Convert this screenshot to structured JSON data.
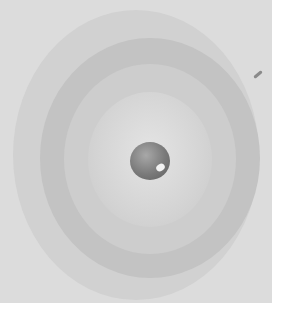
{
  "image": {
    "subject": "concentric rings around a central sphere",
    "description": "Grayscale photograph of concentric circular ripples/rings with a small dark sphere at the center",
    "colors": {
      "background": "#dcdcdc",
      "outer_ring": "#d1d1d1",
      "second_ring": "#c3c3c3",
      "third_ring": "#cdcdcd",
      "inner_disc": "#d4d4d4",
      "sphere": "#7a7a7a",
      "page": "#ffffff"
    },
    "ring_count": 4
  }
}
